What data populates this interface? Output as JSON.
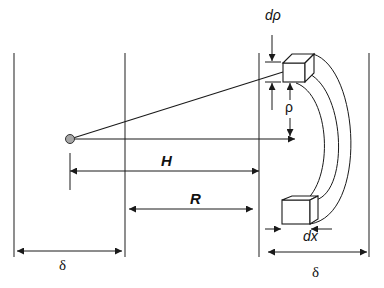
{
  "diagram": {
    "colors": {
      "stroke": "#1a1a1a",
      "boundary": "#444444",
      "point_fill": "#a6a6a6",
      "background": "#ffffff"
    },
    "labels": {
      "d_rho": "dρ",
      "rho": "ρ",
      "H": "H",
      "R": "R",
      "dx": "dx",
      "delta_left": "δ",
      "delta_right": "δ"
    },
    "elements": {
      "boundaries": [
        {
          "name": "left-slab-outer",
          "x": 14
        },
        {
          "name": "left-slab-inner",
          "x": 125
        },
        {
          "name": "right-slab-inner",
          "x": 259
        },
        {
          "name": "right-slab-outer",
          "x": 369
        }
      ],
      "source_point": {
        "x": 70,
        "y": 139
      },
      "volume_elements": [
        "top-box",
        "bottom-box"
      ],
      "dimensions": [
        "dρ",
        "ρ",
        "H",
        "R",
        "dx",
        "δ",
        "δ"
      ]
    }
  }
}
